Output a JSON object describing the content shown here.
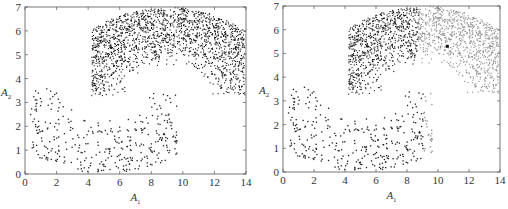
{
  "chart_data": [
    {
      "type": "scatter",
      "title": "",
      "xlabel": "A1",
      "ylabel": "A2",
      "xlim": [
        0,
        14
      ],
      "ylim": [
        0,
        7
      ],
      "xticks": [
        0,
        2,
        4,
        6,
        8,
        10,
        12,
        14
      ],
      "yticks": [
        0,
        1,
        2,
        3,
        4,
        5,
        6,
        7
      ],
      "grid": false,
      "legend": null,
      "series": [
        {
          "name": "upper moon",
          "color": "#111111",
          "shape": "half-ring",
          "center": [
            9.0,
            3.3
          ],
          "radius_range": [
            1.3,
            3.7
          ],
          "angle_range_deg": [
            0,
            180
          ],
          "x_range": [
            4.2,
            13.9
          ],
          "approx_points": 2500
        },
        {
          "name": "lower moon",
          "color": "#222222",
          "shape": "half-ring",
          "center": [
            5.0,
            3.6
          ],
          "radius_range": [
            1.2,
            3.6
          ],
          "angle_range_deg": [
            180,
            360
          ],
          "x_range": [
            0.3,
            9.6
          ],
          "approx_points": 500
        }
      ]
    },
    {
      "type": "scatter",
      "title": "",
      "xlabel": "A1",
      "ylabel": "A2",
      "xlim": [
        0,
        14
      ],
      "ylim": [
        0,
        7
      ],
      "xticks": [
        0,
        2,
        4,
        6,
        8,
        10,
        12,
        14
      ],
      "yticks": [
        0,
        1,
        2,
        3,
        4,
        5,
        6,
        7
      ],
      "grid": false,
      "legend": null,
      "split_x": 8.7,
      "series": [
        {
          "name": "cluster 1 (dark)",
          "color": "#1a1a1a",
          "region": "upper moon, A1 < 8.7 and lower moon, A1 < 9.0"
        },
        {
          "name": "cluster 2 (grey)",
          "color": "#8c8c8c",
          "region": "upper moon, A1 >= 8.7 and lower moon, A1 >= 9.0"
        }
      ],
      "annotations": [
        {
          "type": "outlier-point",
          "x": 10.6,
          "y": 5.3,
          "color": "#111111"
        }
      ]
    }
  ],
  "panels": [
    {
      "xlabel_main": "A",
      "xlabel_sub": "1",
      "ylabel_main": "A",
      "ylabel_sub": "2"
    },
    {
      "xlabel_main": "A",
      "xlabel_sub": "1",
      "ylabel_main": "A",
      "ylabel_sub": "2"
    }
  ]
}
